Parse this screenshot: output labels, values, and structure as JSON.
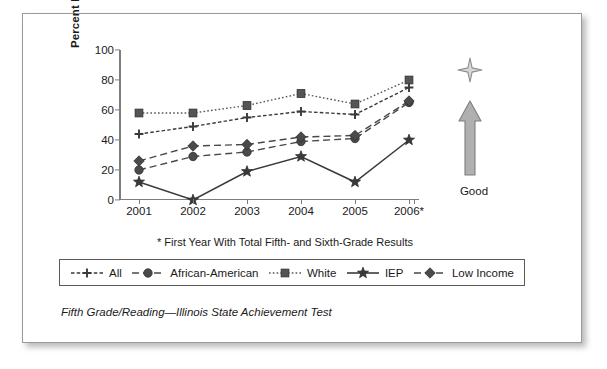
{
  "chart_data": {
    "type": "line",
    "title": "",
    "caption": "Fifth Grade/Reading—Illinois State Achievement Test",
    "footnote": "* First Year With Total Fifth- and Sixth-Grade Results",
    "xlabel": "",
    "ylabel": "Percent Meets/Exceeds",
    "categories": [
      "2001",
      "2002",
      "2003",
      "2004",
      "2005",
      "2006*"
    ],
    "yticks": [
      0,
      20,
      40,
      60,
      80,
      100
    ],
    "ylim": [
      0,
      100
    ],
    "grid": false,
    "legend_position": "below-plot",
    "series": [
      {
        "name": "All",
        "marker": "plus",
        "dash": "dashed-fine",
        "color": "#3a3a3a",
        "values": [
          44,
          49,
          55,
          59,
          57,
          75
        ]
      },
      {
        "name": "African-American",
        "marker": "circle",
        "dash": "dashed-long",
        "color": "#4a4a4a",
        "values": [
          20,
          29,
          32,
          39,
          41,
          65
        ]
      },
      {
        "name": "White",
        "marker": "square",
        "dash": "dotted",
        "color": "#555555",
        "values": [
          58,
          58,
          63,
          71,
          64,
          80
        ]
      },
      {
        "name": "IEP",
        "marker": "star",
        "dash": "solid",
        "color": "#3a3a3a",
        "values": [
          12,
          0,
          19,
          29,
          12,
          40
        ]
      },
      {
        "name": "Low Income",
        "marker": "diamond",
        "dash": "dashed-long",
        "color": "#4a4a4a",
        "values": [
          26,
          36,
          37,
          42,
          43,
          66
        ]
      }
    ],
    "annotation": {
      "label": "Good",
      "direction": "up",
      "sparkle_icon": "four-point-star-icon",
      "arrow_icon": "up-arrow-icon",
      "color": "#9d9d9d"
    }
  }
}
